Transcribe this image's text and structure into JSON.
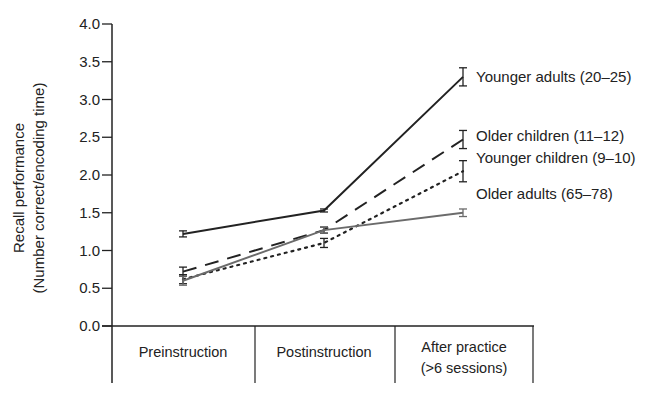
{
  "chart_data": {
    "type": "line",
    "title": "",
    "xlabel": "",
    "ylabel": "Recall performance",
    "ylabel_sub": "(Number correct/encoding time)",
    "ylim": [
      0,
      4.0
    ],
    "yticks": [
      "0.0",
      "0.5",
      "1.0",
      "1.5",
      "2.0",
      "2.5",
      "3.0",
      "3.5",
      "4.0"
    ],
    "grid": false,
    "legend_position": "inline-right",
    "categories": [
      {
        "line1": "Preinstruction",
        "line2": ""
      },
      {
        "line1": "Postinstruction",
        "line2": ""
      },
      {
        "line1": "After practice",
        "line2": "(>6 sessions)"
      }
    ],
    "series": [
      {
        "name": "Younger adults (20–25)",
        "style": "solid",
        "color": "#222222",
        "values": [
          1.22,
          1.53,
          3.3
        ],
        "err": [
          0.04,
          0.02,
          0.12
        ]
      },
      {
        "name": "Older children (11–12)",
        "style": "dashed",
        "color": "#222222",
        "values": [
          0.72,
          1.27,
          2.47
        ],
        "err": [
          0.06,
          0.04,
          0.12
        ]
      },
      {
        "name": "Younger children (9–10)",
        "style": "dotted",
        "color": "#222222",
        "values": [
          0.62,
          1.1,
          2.05
        ],
        "err": [
          0.06,
          0.06,
          0.14
        ]
      },
      {
        "name": "Older adults (65–78)",
        "style": "solid",
        "color": "#6b6b6b",
        "values": [
          0.6,
          1.27,
          1.5
        ],
        "err": [
          0.06,
          0.04,
          0.05
        ]
      }
    ]
  }
}
